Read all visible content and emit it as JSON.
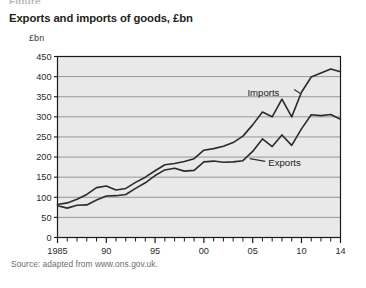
{
  "figure": {
    "caption_stub": "Figure",
    "title": "Exports and imports of goods, £bn",
    "source": "Source: adapted from www.ons.gov.uk."
  },
  "colors": {
    "plot_background": "#e9e9e9",
    "plot_border": "#1a1a1a",
    "gridline": "#8d8d8d",
    "line": "#2b2b2b",
    "page_background": "#ffffff",
    "title_text": "#231f20",
    "source_text": "#6d6d6d"
  },
  "chart_data": {
    "type": "line",
    "title": "Exports and imports of goods, £bn",
    "subtitle": "",
    "xlabel": "",
    "ylabel": "£bn",
    "ylim": [
      0,
      450
    ],
    "xlim": [
      1985,
      2014
    ],
    "y_ticks": [
      0,
      50,
      100,
      150,
      200,
      250,
      300,
      350,
      400,
      450
    ],
    "y_tick_labels": [
      "0",
      "50",
      "100",
      "150",
      "200",
      "250",
      "300",
      "350",
      "400",
      "450"
    ],
    "x_ticks": [
      1985,
      1986,
      1987,
      1988,
      1989,
      1990,
      1991,
      1992,
      1993,
      1994,
      1995,
      1996,
      1997,
      1998,
      1999,
      2000,
      2001,
      2002,
      2003,
      2004,
      2005,
      2006,
      2007,
      2008,
      2009,
      2010,
      2011,
      2012,
      2013,
      2014
    ],
    "x_tick_labels": [
      {
        "x": 1985,
        "label": "1985"
      },
      {
        "x": 1990,
        "label": "90"
      },
      {
        "x": 1995,
        "label": "95"
      },
      {
        "x": 2000,
        "label": "00"
      },
      {
        "x": 2005,
        "label": "05"
      },
      {
        "x": 2010,
        "label": "10"
      },
      {
        "x": 2014,
        "label": "14"
      }
    ],
    "grid": true,
    "grid_axis": "y",
    "legend": "inline-annotations",
    "annotations": [
      {
        "text": "Imports",
        "series": "Imports",
        "x": 2006.1,
        "y": 352
      },
      {
        "text": "Exports",
        "series": "Exports",
        "x": 2006.6,
        "y": 178
      }
    ],
    "x": [
      1985,
      1986,
      1987,
      1988,
      1989,
      1990,
      1991,
      1992,
      1993,
      1994,
      1995,
      1996,
      1997,
      1998,
      1999,
      2000,
      2001,
      2002,
      2003,
      2004,
      2005,
      2006,
      2007,
      2008,
      2009,
      2010,
      2011,
      2012,
      2013,
      2014
    ],
    "series": [
      {
        "name": "Imports",
        "values": [
          82,
          86,
          95,
          107,
          124,
          128,
          118,
          122,
          137,
          150,
          166,
          181,
          184,
          189,
          196,
          217,
          221,
          227,
          236,
          252,
          280,
          312,
          300,
          344,
          300,
          361,
          399,
          409,
          419,
          412
        ]
      },
      {
        "name": "Exports",
        "values": [
          79,
          73,
          80,
          81,
          93,
          103,
          104,
          107,
          122,
          136,
          154,
          168,
          172,
          165,
          167,
          188,
          190,
          187,
          188,
          191,
          214,
          245,
          226,
          255,
          229,
          270,
          305,
          303,
          306,
          294
        ]
      }
    ]
  }
}
